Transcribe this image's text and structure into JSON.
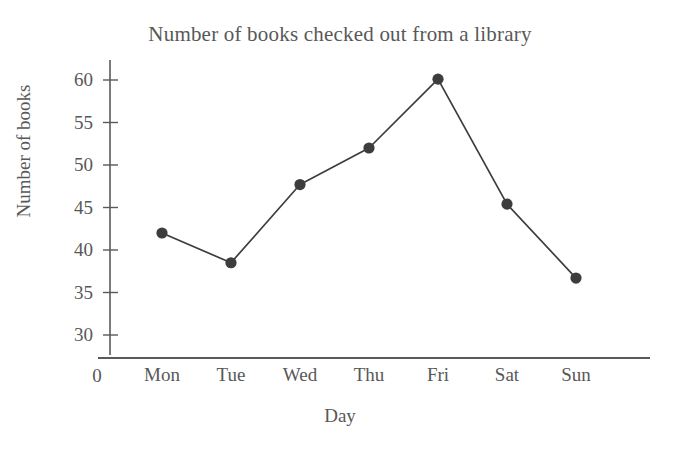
{
  "chart_data": {
    "type": "line",
    "title": "Number of books checked out from a library",
    "xlabel": "Day",
    "ylabel": "Number of books",
    "categories": [
      "Mon",
      "Tue",
      "Wed",
      "Thu",
      "Fri",
      "Sat",
      "Sun"
    ],
    "values": [
      42.0,
      38.5,
      47.7,
      52.0,
      60.1,
      45.4,
      36.7
    ],
    "ytick_labels": [
      "30",
      "35",
      "40",
      "45",
      "50",
      "55",
      "60"
    ],
    "ytick_values": [
      30,
      35,
      40,
      45,
      50,
      55,
      60
    ],
    "ylim": [
      27,
      62
    ],
    "origin_label": "0",
    "grid": false,
    "legend": null,
    "series": [
      {
        "name": "Number of books",
        "values": [
          42.0,
          38.5,
          47.7,
          52.0,
          60.1,
          45.4,
          36.7
        ],
        "color": "#3d3d3d",
        "marker": "circle",
        "line_style": "solid"
      }
    ]
  },
  "style": {
    "line_color": "#3d3d3d",
    "marker_color": "#3d3d3d",
    "axis_color": "#5a5a5a",
    "text_color": "#585858",
    "background": "#ffffff"
  }
}
